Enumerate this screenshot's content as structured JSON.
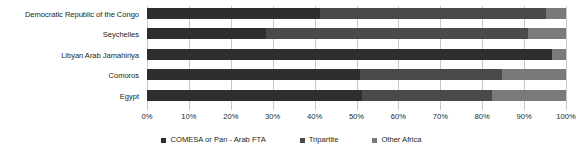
{
  "chart_data": {
    "type": "bar",
    "orientation": "horizontal",
    "stacked": true,
    "stack_mode": "percent",
    "title": "",
    "xlabel": "",
    "ylabel": "",
    "xlim": [
      0,
      100
    ],
    "grid": true,
    "legend_position": "bottom",
    "categories": [
      "Democratic Republic of the Congo",
      "Seychelles",
      "Libyan Arab Jamahiriya",
      "Comoros",
      "Egypt"
    ],
    "tick_labels": [
      "0%",
      "10%",
      "20%",
      "30%",
      "40%",
      "50%",
      "60%",
      "70%",
      "80%",
      "90%",
      "100%"
    ],
    "tick_values": [
      0,
      10,
      20,
      30,
      40,
      50,
      60,
      70,
      80,
      90,
      100
    ],
    "series": [
      {
        "name": "COMESA or Pan - Arab FTA",
        "color": "#2e2e2e",
        "values": [
          41.3,
          28.4,
          96.7,
          50.8,
          51.3
        ]
      },
      {
        "name": "Tripartite",
        "color": "#4a4a4a",
        "values": [
          53.9,
          62.6,
          0.0,
          33.9,
          31.0
        ]
      },
      {
        "name": "Other Africa",
        "color": "#7a7a7a",
        "values": [
          4.8,
          9.0,
          3.3,
          15.3,
          17.7
        ]
      }
    ]
  },
  "legend": {
    "items": [
      {
        "label": "COMESA or Pan - Arab FTA"
      },
      {
        "label": "Tripartite"
      },
      {
        "label": "Other Africa"
      }
    ]
  }
}
